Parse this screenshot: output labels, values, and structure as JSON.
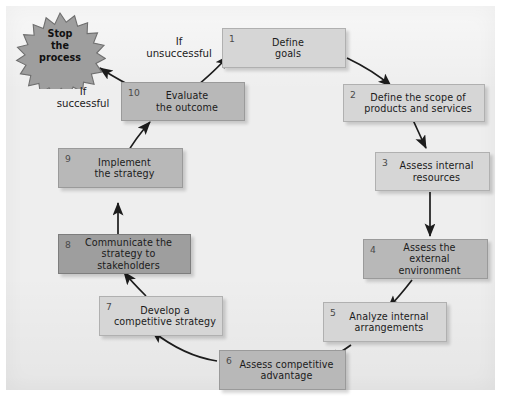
{
  "diagram": {
    "background_color": "#eeeeee",
    "terminator": {
      "label": "Stop\nthe\nprocess",
      "shape": "starburst",
      "fill": "#9e9e9e"
    },
    "nodes": [
      {
        "number": "1",
        "label": "Define\ngoals",
        "tone": "light"
      },
      {
        "number": "2",
        "label": "Define the scope of\nproducts and services",
        "tone": "light"
      },
      {
        "number": "3",
        "label": "Assess internal\nresources",
        "tone": "light"
      },
      {
        "number": "4",
        "label": "Assess the\nexternal environment",
        "tone": "mid"
      },
      {
        "number": "5",
        "label": "Analyze internal\narrangements",
        "tone": "light"
      },
      {
        "number": "6",
        "label": "Assess competitive\nadvantage",
        "tone": "mid"
      },
      {
        "number": "7",
        "label": "Develop a\ncompetitive strategy",
        "tone": "light"
      },
      {
        "number": "8",
        "label": "Communicate the\nstrategy to stakeholders",
        "tone": "dark"
      },
      {
        "number": "9",
        "label": "Implement\nthe strategy",
        "tone": "mid"
      },
      {
        "number": "10",
        "label": "Evaluate\nthe outcome",
        "tone": "mid"
      }
    ],
    "annotations": [
      {
        "id": "if-unsuccessful",
        "label": "If\nunsuccessful"
      },
      {
        "id": "if-successful",
        "label": "If\nsuccessful"
      }
    ]
  }
}
